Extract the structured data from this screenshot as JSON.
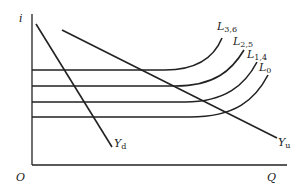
{
  "diagram": {
    "type": "economic-curve-diagram",
    "axes": {
      "y_label": "i",
      "x_label": "Q",
      "origin_label": "O"
    },
    "curves": [
      {
        "id": "L0",
        "label_main": "L",
        "label_sub": "0",
        "flat_level_y": 117
      },
      {
        "id": "L14",
        "label_main": "L",
        "label_sub": "1,4",
        "flat_level_y": 102
      },
      {
        "id": "L25",
        "label_main": "L",
        "label_sub": "2,5",
        "flat_level_y": 86
      },
      {
        "id": "L36",
        "label_main": "L",
        "label_sub": "3,6",
        "flat_level_y": 70
      }
    ],
    "lines": [
      {
        "id": "Yd",
        "label_main": "Y",
        "label_sub": "d",
        "description": "steep downward-sloping line"
      },
      {
        "id": "Yu",
        "label_main": "Y",
        "label_sub": "u",
        "description": "shallow downward-sloping line"
      }
    ],
    "colors": {
      "stroke": "#222222",
      "background": "#ffffff"
    }
  }
}
